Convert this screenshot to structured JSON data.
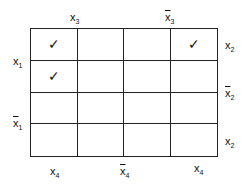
{
  "map": {
    "top_labels": [
      {
        "var": "x",
        "sub": "3",
        "bar": false
      },
      {
        "var": "x",
        "sub": "3",
        "bar": true
      }
    ],
    "left_labels": [
      {
        "var": "x",
        "sub": "1",
        "bar": false
      },
      {
        "var": "x",
        "sub": "1",
        "bar": true
      }
    ],
    "right_labels": [
      {
        "var": "x",
        "sub": "2",
        "bar": false
      },
      {
        "var": "x",
        "sub": "2",
        "bar": true
      },
      {
        "var": "x",
        "sub": "2",
        "bar": false
      }
    ],
    "bottom_labels": [
      {
        "var": "x",
        "sub": "4",
        "bar": false
      },
      {
        "var": "x",
        "sub": "4",
        "bar": true
      },
      {
        "var": "x",
        "sub": "4",
        "bar": false
      }
    ],
    "cells": [
      [
        "✓",
        "",
        "",
        "✓"
      ],
      [
        "✓",
        "",
        "",
        ""
      ],
      [
        "",
        "",
        "",
        ""
      ],
      [
        "",
        "",
        "",
        ""
      ]
    ]
  }
}
